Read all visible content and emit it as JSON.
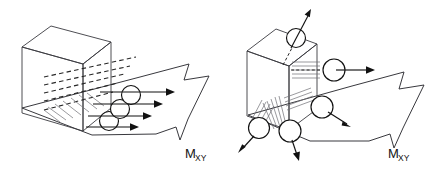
{
  "figure": {
    "background_color": "#ffffff",
    "ink_color": "#111111",
    "width": 429,
    "height": 171
  },
  "panels": [
    {
      "id": "left",
      "name": "distributed-twisting-moment-panel",
      "description": "Cube element with distributed shear arrows passing through circles and a large outlined resultant arrow",
      "cube": {
        "name": "plate-element-cube",
        "face_fill": "#ffffff",
        "edge_color": "#3a3a40"
      },
      "force_arrows_count": 4,
      "circles_count": 3,
      "dashed_lines_count": 5,
      "resultant_arrow": {
        "name": "resultant-moment-arrow",
        "style": "outlined",
        "direction": "down-right"
      },
      "label": {
        "base": "M",
        "subscript": "XY"
      }
    },
    {
      "id": "right",
      "name": "resolved-force-couples-panel",
      "description": "Cube element with corner force couples shown as circles with arrows in three directions and a large outlined resultant arrow",
      "cube": {
        "name": "plate-element-cube",
        "face_fill": "#ffffff",
        "edge_color": "#3a3a40"
      },
      "circles": [
        {
          "name": "top-force-circle",
          "arrow_direction": "up-right"
        },
        {
          "name": "right-force-circle",
          "arrow_direction": "right"
        },
        {
          "name": "lower-right-force-circle",
          "arrow_direction": "down-right"
        },
        {
          "name": "bottom-center-force-circle",
          "arrow_direction": "down"
        },
        {
          "name": "bottom-left-force-circle",
          "arrow_direction": "down-left"
        }
      ],
      "hatch_groups": 3,
      "resultant_arrow": {
        "name": "resultant-moment-arrow",
        "style": "outlined",
        "direction": "down-right"
      },
      "label": {
        "base": "M",
        "subscript": "XY"
      }
    }
  ],
  "labels": {
    "left_moment_base": "M",
    "left_moment_sub": "XY",
    "right_moment_base": "M",
    "right_moment_sub": "XY"
  }
}
